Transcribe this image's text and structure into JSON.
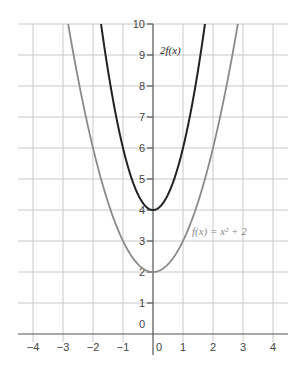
{
  "chart_data": {
    "type": "line",
    "title": "",
    "xlabel": "",
    "ylabel": "",
    "xlim": [
      -4.5,
      4.5
    ],
    "ylim": [
      -0.5,
      10
    ],
    "grid": true,
    "legend": "inline labels",
    "x_ticks": [
      "−4",
      "−3",
      "−2",
      "−1",
      "0",
      "1",
      "2",
      "3",
      "4"
    ],
    "y_ticks": [
      "0",
      "1",
      "2",
      "3",
      "4",
      "5",
      "6",
      "7",
      "8",
      "9",
      "10"
    ],
    "series": [
      {
        "name": "f(x) = x² + 2",
        "label": "f(x) = x² + 2",
        "color": "#8a8a8a",
        "x": [
          -2.83,
          -2,
          -1,
          0,
          1,
          2,
          2.83
        ],
        "y": [
          10,
          6,
          3,
          2,
          3,
          6,
          10
        ]
      },
      {
        "name": "2f(x)",
        "label": "2f(x)",
        "color": "#222222",
        "x": [
          -1.73,
          -1,
          0,
          1,
          1.73
        ],
        "y": [
          10,
          6,
          4,
          6,
          10
        ]
      }
    ],
    "annotations": [
      {
        "text": "2f(x)",
        "x": 0.3,
        "y": 9.1
      },
      {
        "text": "f(x) = x² + 2",
        "x": 1.3,
        "y": 3.2
      }
    ]
  }
}
